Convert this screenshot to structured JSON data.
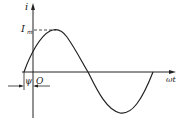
{
  "diagram": {
    "labels": {
      "y_axis": "i",
      "x_axis": "ωt",
      "amplitude": "I",
      "amplitude_sub": "m",
      "phase": "ψ",
      "origin": "O"
    },
    "colors": {
      "line": "#222222",
      "background": "#ffffff"
    }
  }
}
